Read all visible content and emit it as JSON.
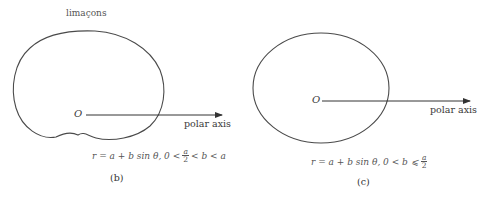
{
  "title": "limaçons",
  "panels": [
    {
      "id": "b",
      "origin_label": "O",
      "axis_label": "polar axis",
      "formula": {
        "lhs": "r = a + b sin θ, 0 <",
        "frac_num": "a",
        "frac_den": "2",
        "rhs": "< b < a"
      },
      "caption": "(b)",
      "curve": "dimpled limaçon"
    },
    {
      "id": "c",
      "origin_label": "O",
      "axis_label": "polar axis",
      "formula": {
        "lhs": "r = a + b sin θ, 0 < b ⩽",
        "frac_num": "a",
        "frac_den": "2",
        "rhs": ""
      },
      "caption": "(c)",
      "curve": "convex limaçon"
    }
  ],
  "colors": {
    "stroke": "#4a4a4a",
    "text": "#3a3a3a"
  }
}
